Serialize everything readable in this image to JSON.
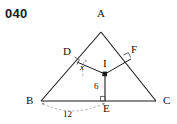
{
  "problem": {
    "number": "040"
  },
  "figure": {
    "type": "geometry-diagram",
    "stroke_color": "#1a1a1a",
    "dash_color": "#8a8a8a",
    "background": "#ffffff",
    "vertices": [
      {
        "name": "A",
        "label": "A",
        "x": 101,
        "y": 27
      },
      {
        "name": "B",
        "label": "B",
        "x": 36,
        "y": 102
      },
      {
        "name": "C",
        "label": "C",
        "x": 160,
        "y": 102
      }
    ],
    "points": [
      {
        "name": "D",
        "label": "D",
        "x": 72,
        "y": 56
      },
      {
        "name": "F",
        "label": "F",
        "x": 128,
        "y": 53
      },
      {
        "name": "E",
        "label": "E",
        "x": 105,
        "y": 102
      },
      {
        "name": "I",
        "label": "I",
        "x": 105,
        "y": 74
      }
    ],
    "measures": [
      {
        "name": "angle-x",
        "label": "x",
        "at": "D",
        "x": 84,
        "y": 70
      },
      {
        "name": "inradius",
        "label": "6",
        "segment": "IE",
        "x": 97,
        "y": 89
      },
      {
        "name": "base-segment",
        "label": "12",
        "segment": "BE",
        "x": 70,
        "y": 117
      }
    ],
    "right_angle_marks": [
      "D",
      "F",
      "E"
    ]
  }
}
